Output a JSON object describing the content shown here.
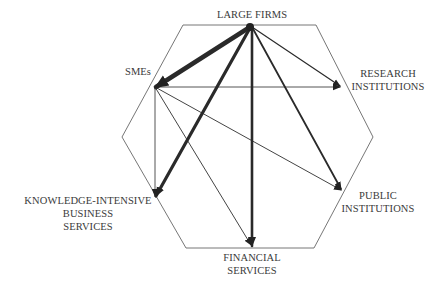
{
  "diagram": {
    "type": "network",
    "hexagon_stroke": "#555555",
    "arrow_color": "#222222",
    "nodes": [
      {
        "id": "large_firms",
        "label": "LARGE FIRMS",
        "lines": [
          "LARGE FIRMS"
        ],
        "x": 252,
        "y": 27
      },
      {
        "id": "smes",
        "label": "SMEs",
        "lines": [
          "SMEs"
        ],
        "x": 155,
        "y": 87
      },
      {
        "id": "research",
        "label": "RESEARCH INSTITUTIONS",
        "lines": [
          "RESEARCH",
          "INSTITUTIONS"
        ],
        "x": 341,
        "y": 86
      },
      {
        "id": "public",
        "label": "PUBLIC INSTITUTIONS",
        "lines": [
          "PUBLIC",
          "INSTITUTIONS"
        ],
        "x": 342,
        "y": 190
      },
      {
        "id": "kibs",
        "label": "KNOWLEDGE-INTENSIVE BUSINESS SERVICES",
        "lines": [
          "KNOWLEDGE-INTENSIVE",
          "BUSINESS",
          "SERVICES"
        ],
        "x": 155,
        "y": 197
      },
      {
        "id": "financial",
        "label": "FINANCIAL SERVICES",
        "lines": [
          "FINANCIAL",
          "SERVICES"
        ],
        "x": 252,
        "y": 246
      }
    ],
    "edges": [
      {
        "from": "large_firms",
        "to": "smes",
        "weight": "very-strong"
      },
      {
        "from": "large_firms",
        "to": "kibs",
        "weight": "strong"
      },
      {
        "from": "large_firms",
        "to": "financial",
        "weight": "strong"
      },
      {
        "from": "large_firms",
        "to": "public",
        "weight": "medium"
      },
      {
        "from": "large_firms",
        "to": "research",
        "weight": "weak"
      },
      {
        "from": "smes",
        "to": "research",
        "weight": "weak"
      },
      {
        "from": "smes",
        "to": "public",
        "weight": "weak"
      },
      {
        "from": "smes",
        "to": "financial",
        "weight": "weak"
      },
      {
        "from": "smes",
        "to": "kibs",
        "weight": "weak"
      }
    ]
  }
}
